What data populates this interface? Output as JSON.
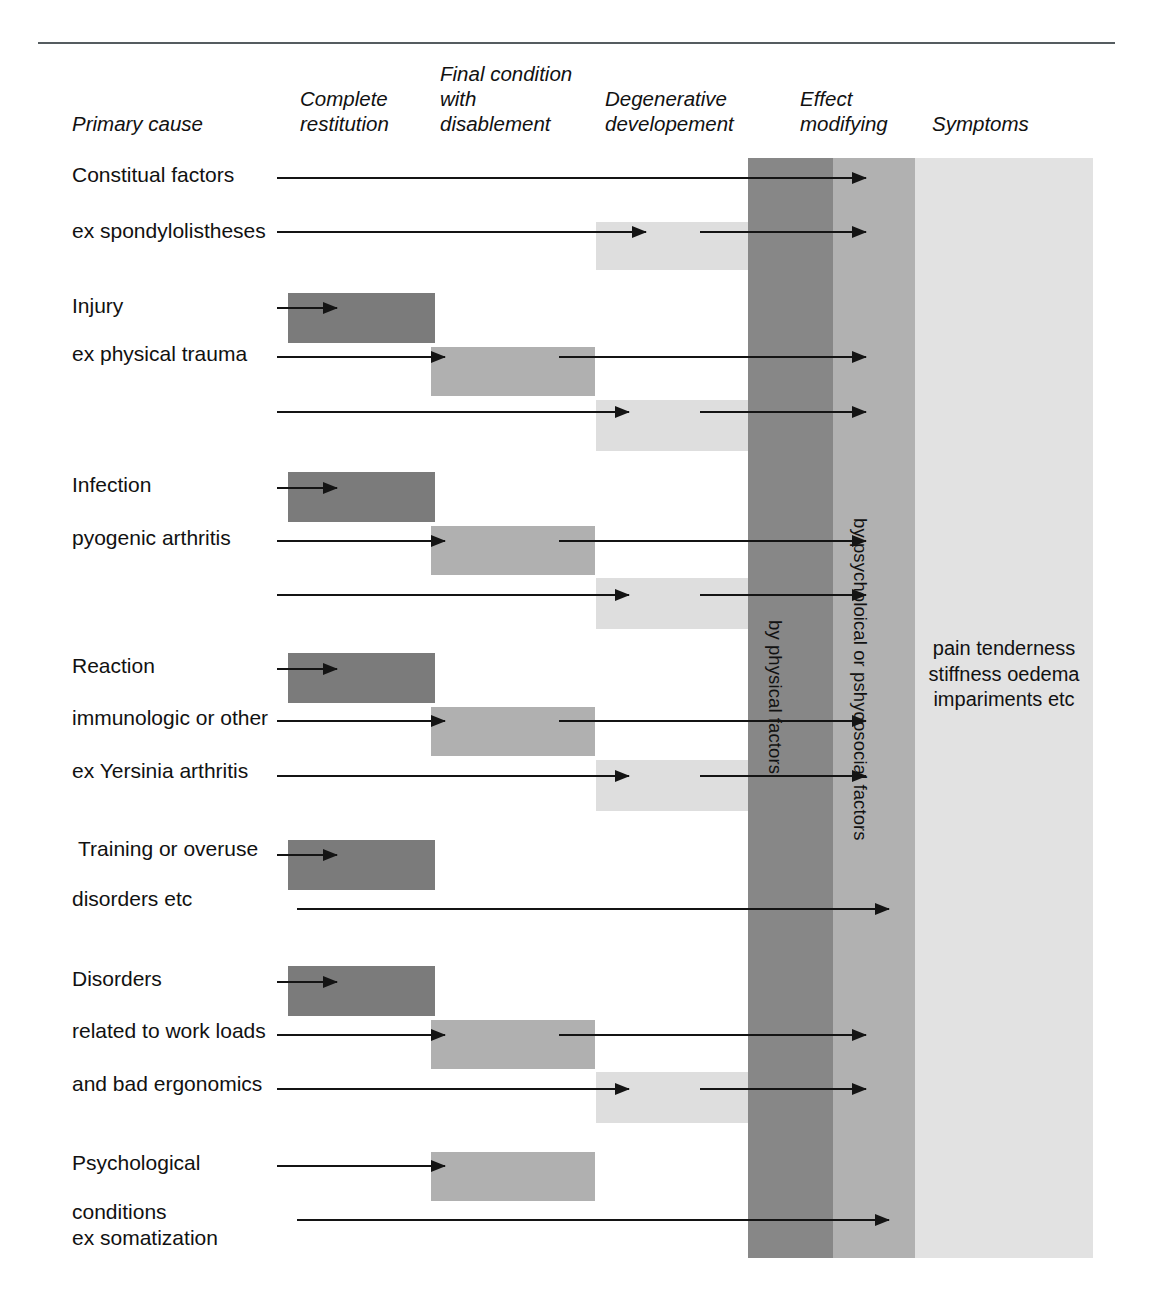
{
  "page": {
    "running_head_left": "",
    "running_head_right": ""
  },
  "columns": [
    {
      "id": "primary-cause",
      "label": "Primary cause",
      "x": 72,
      "y": 111
    },
    {
      "id": "complete-restitution",
      "label": "Complete\nrestitution",
      "x": 300,
      "y": 86
    },
    {
      "id": "final-condition",
      "label": "Final condition\nwith\ndisablement",
      "x": 440,
      "y": 61
    },
    {
      "id": "degenerative",
      "label": "Degenerative\ndevelopement",
      "x": 605,
      "y": 86
    },
    {
      "id": "effect-modifying",
      "label": "Effect\nmodifying",
      "x": 800,
      "y": 86
    },
    {
      "id": "symptoms",
      "label": "Symptoms",
      "x": 932,
      "y": 111
    }
  ],
  "bands": [
    {
      "id": "physical",
      "label": "by physical factors",
      "color": "#878787"
    },
    {
      "id": "psychosocial",
      "label": "by psycholoical or pshycosocial factors",
      "color": "#b1b1b1"
    },
    {
      "id": "symptoms",
      "label": "",
      "color": "#e2e2e2"
    }
  ],
  "symptoms_list": "pain\ntenderness\nstiffness\noedema\nimpariments\netc",
  "groups": [
    {
      "id": "constitutional",
      "labels": [
        {
          "text": "Constitual factors",
          "x": 72,
          "y": 162
        },
        {
          "text": "ex spondylolistheses",
          "x": 72,
          "y": 218
        }
      ]
    },
    {
      "id": "injury",
      "labels": [
        {
          "text": "Injury",
          "x": 72,
          "y": 293
        },
        {
          "text": "ex physical trauma",
          "x": 72,
          "y": 341
        }
      ]
    },
    {
      "id": "infection",
      "labels": [
        {
          "text": "Infection",
          "x": 72,
          "y": 472
        },
        {
          "text": "pyogenic arthritis",
          "x": 72,
          "y": 525
        }
      ]
    },
    {
      "id": "reaction",
      "labels": [
        {
          "text": "Reaction",
          "x": 72,
          "y": 653
        },
        {
          "text": "immunologic or other",
          "x": 72,
          "y": 705
        },
        {
          "text": "ex Yersinia arthritis",
          "x": 72,
          "y": 758
        }
      ]
    },
    {
      "id": "training",
      "labels": [
        {
          "text": "Training or overuse",
          "x": 78,
          "y": 836
        },
        {
          "text": "disorders etc",
          "x": 72,
          "y": 886
        }
      ]
    },
    {
      "id": "disorders",
      "labels": [
        {
          "text": "Disorders",
          "x": 72,
          "y": 966
        },
        {
          "text": "related to work loads",
          "x": 72,
          "y": 1018
        },
        {
          "text": "and bad ergonomics",
          "x": 72,
          "y": 1071
        }
      ]
    },
    {
      "id": "psychological",
      "labels": [
        {
          "text": "Psychological",
          "x": 72,
          "y": 1150
        },
        {
          "text": "conditions\nex somatization",
          "x": 72,
          "y": 1199
        }
      ]
    }
  ],
  "boxes": [
    {
      "id": "spondylolistheses-degenerative",
      "tone": "light",
      "x": 596,
      "y": 222,
      "w": 152,
      "h": 48
    },
    {
      "id": "injury-complete-restitution",
      "tone": "dark",
      "x": 288,
      "y": 293,
      "w": 147,
      "h": 50
    },
    {
      "id": "injury-final-condition",
      "tone": "mid",
      "x": 431,
      "y": 347,
      "w": 164,
      "h": 49
    },
    {
      "id": "injury-degenerative",
      "tone": "light",
      "x": 596,
      "y": 400,
      "w": 152,
      "h": 51
    },
    {
      "id": "infection-complete-restitution",
      "tone": "dark",
      "x": 288,
      "y": 472,
      "w": 147,
      "h": 50
    },
    {
      "id": "infection-final-condition",
      "tone": "mid",
      "x": 431,
      "y": 526,
      "w": 164,
      "h": 49
    },
    {
      "id": "infection-degenerative",
      "tone": "light",
      "x": 596,
      "y": 578,
      "w": 152,
      "h": 51
    },
    {
      "id": "reaction-complete-restitution",
      "tone": "dark",
      "x": 288,
      "y": 653,
      "w": 147,
      "h": 50
    },
    {
      "id": "reaction-final-condition",
      "tone": "mid",
      "x": 431,
      "y": 707,
      "w": 164,
      "h": 49
    },
    {
      "id": "reaction-degenerative",
      "tone": "light",
      "x": 596,
      "y": 760,
      "w": 152,
      "h": 51
    },
    {
      "id": "training-complete-restitution",
      "tone": "dark",
      "x": 288,
      "y": 840,
      "w": 147,
      "h": 50
    },
    {
      "id": "disorders-complete-restitution",
      "tone": "dark",
      "x": 288,
      "y": 966,
      "w": 147,
      "h": 50
    },
    {
      "id": "disorders-final-condition",
      "tone": "mid",
      "x": 431,
      "y": 1020,
      "w": 164,
      "h": 49
    },
    {
      "id": "disorders-degenerative",
      "tone": "light",
      "x": 596,
      "y": 1072,
      "w": 152,
      "h": 51
    },
    {
      "id": "psychological-final-condition",
      "tone": "mid",
      "x": 431,
      "y": 1152,
      "w": 164,
      "h": 49
    }
  ],
  "arrows": [
    {
      "id": "constitual-to-effect",
      "x": 277,
      "y": 177,
      "w": 589
    },
    {
      "id": "spondylolistheses-to-degen",
      "x": 277,
      "y": 231,
      "w": 369
    },
    {
      "id": "spondylolistheses-to-effect",
      "x": 700,
      "y": 231,
      "w": 166
    },
    {
      "id": "injury-to-restitution",
      "x": 277,
      "y": 307,
      "w": 60
    },
    {
      "id": "trauma-to-final",
      "x": 277,
      "y": 356,
      "w": 168
    },
    {
      "id": "trauma-final-to-effect",
      "x": 559,
      "y": 356,
      "w": 307
    },
    {
      "id": "trauma-to-degen",
      "x": 277,
      "y": 411,
      "w": 352
    },
    {
      "id": "trauma-degen-to-effect",
      "x": 700,
      "y": 411,
      "w": 166
    },
    {
      "id": "infection-to-restitution",
      "x": 277,
      "y": 487,
      "w": 60
    },
    {
      "id": "pyogenic-to-final",
      "x": 277,
      "y": 540,
      "w": 168
    },
    {
      "id": "pyogenic-final-to-effect",
      "x": 559,
      "y": 540,
      "w": 307
    },
    {
      "id": "pyogenic-to-degen",
      "x": 277,
      "y": 594,
      "w": 352
    },
    {
      "id": "pyogenic-degen-to-effect",
      "x": 700,
      "y": 594,
      "w": 166
    },
    {
      "id": "reaction-to-restitution",
      "x": 277,
      "y": 668,
      "w": 60
    },
    {
      "id": "immunologic-to-final",
      "x": 277,
      "y": 720,
      "w": 168
    },
    {
      "id": "immunologic-final-to-effect",
      "x": 559,
      "y": 720,
      "w": 307
    },
    {
      "id": "yersinia-to-degen",
      "x": 277,
      "y": 775,
      "w": 352
    },
    {
      "id": "yersinia-degen-to-effect",
      "x": 700,
      "y": 775,
      "w": 166
    },
    {
      "id": "training-to-restitution",
      "x": 277,
      "y": 854,
      "w": 60
    },
    {
      "id": "disorders-etc-to-effect",
      "x": 297,
      "y": 908,
      "w": 592
    },
    {
      "id": "disorders-to-restitution",
      "x": 277,
      "y": 981,
      "w": 60
    },
    {
      "id": "workloads-to-final",
      "x": 277,
      "y": 1034,
      "w": 168
    },
    {
      "id": "workloads-final-to-effect",
      "x": 559,
      "y": 1034,
      "w": 307
    },
    {
      "id": "ergonomics-to-degen",
      "x": 277,
      "y": 1088,
      "w": 352
    },
    {
      "id": "ergonomics-degen-to-effect",
      "x": 700,
      "y": 1088,
      "w": 166
    },
    {
      "id": "psychological-to-final",
      "x": 277,
      "y": 1165,
      "w": 168
    },
    {
      "id": "somatization-to-effect",
      "x": 297,
      "y": 1219,
      "w": 592
    }
  ]
}
